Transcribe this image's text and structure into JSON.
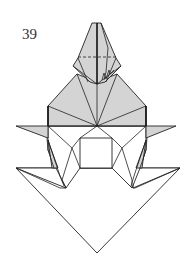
{
  "diagram": {
    "step_number": "39",
    "colors": {
      "colored_side": "#d4d4d4",
      "white_side": "#ffffff",
      "line": "#222222"
    }
  }
}
